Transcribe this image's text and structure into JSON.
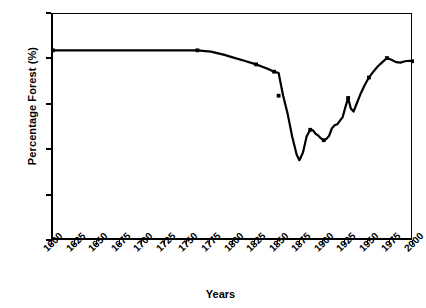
{
  "chart_data": {
    "type": "line",
    "title": "",
    "xlabel": "Years",
    "ylabel": "Percentage Forest (%)",
    "xlim": [
      1600,
      2000
    ],
    "ylim": [
      50,
      100
    ],
    "yticks": [
      50,
      60,
      70,
      80,
      90,
      100
    ],
    "xticks": [
      1600,
      1625,
      1650,
      1675,
      1700,
      1725,
      1750,
      1775,
      1800,
      1825,
      1850,
      1875,
      1900,
      1925,
      1950,
      1975,
      2000
    ],
    "grid": false,
    "legend": null,
    "line_color": "#000000",
    "marker": "square",
    "series": [
      {
        "name": "Percentage Forest",
        "x": [
          1600,
          1625,
          1650,
          1675,
          1700,
          1725,
          1750,
          1760,
          1775,
          1790,
          1800,
          1812,
          1825,
          1837,
          1845,
          1850,
          1855,
          1860,
          1865,
          1870,
          1873,
          1877,
          1881,
          1885,
          1888,
          1891,
          1894,
          1897,
          1900,
          1903,
          1906,
          1909,
          1912,
          1915,
          1918,
          1921,
          1924,
          1927,
          1930,
          1933,
          1937,
          1941,
          1945,
          1950,
          1955,
          1960,
          1965,
          1970,
          1975,
          1980,
          1985,
          1990,
          1995,
          2000
        ],
        "values": [
          92.0,
          92.0,
          92.0,
          92.0,
          92.0,
          92.0,
          92.0,
          92.0,
          91.7,
          91.0,
          90.4,
          89.7,
          88.9,
          88.0,
          87.3,
          87.0,
          82.0,
          78.0,
          73.0,
          69.0,
          67.8,
          69.5,
          73.0,
          74.5,
          74.4,
          73.6,
          73.2,
          72.6,
          72.2,
          72.5,
          73.2,
          74.8,
          75.5,
          75.7,
          76.5,
          77.3,
          79.5,
          81.5,
          79.2,
          78.5,
          80.5,
          82.5,
          84.2,
          86.0,
          87.3,
          88.5,
          89.4,
          90.3,
          89.9,
          89.4,
          89.3,
          89.6,
          89.7,
          89.6
        ]
      }
    ],
    "marker_points": {
      "x": [
        1600,
        1760,
        1825,
        1845,
        1850,
        1885,
        1900,
        1927,
        1950,
        1970,
        2000
      ],
      "values": [
        92.0,
        92.0,
        88.9,
        87.3,
        82.0,
        74.5,
        72.2,
        81.5,
        86.0,
        90.3,
        89.6
      ]
    }
  },
  "axes": {
    "ylabel": "Percentage Forest (%)",
    "xlabel": "Years",
    "ytick_labels": [
      "100",
      "90",
      "80",
      "70",
      "60",
      "50"
    ],
    "xtick_labels": [
      "1600",
      "1625",
      "1650",
      "1675",
      "1700",
      "1725",
      "1750",
      "1775",
      "1800",
      "1825",
      "1850",
      "1875",
      "1900",
      "1925",
      "1950",
      "1975",
      "2000"
    ]
  }
}
